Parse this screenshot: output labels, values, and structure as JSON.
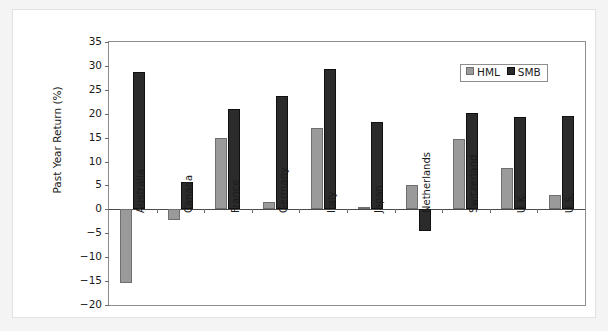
{
  "chart_data": {
    "type": "bar",
    "title": "",
    "xlabel": "",
    "ylabel": "Past Year Return (%)",
    "ylim": [
      -20,
      35
    ],
    "ytick_step": 5,
    "yticks": [
      "35",
      "30",
      "25",
      "20",
      "15",
      "10",
      "5",
      "0",
      "−5",
      "−10",
      "−15",
      "−20"
    ],
    "grid": false,
    "legend_position": "top-right",
    "categories": [
      "Australia",
      "Canada",
      "France",
      "Germany",
      "Italy",
      "Japan",
      "Netherlands",
      "Switzerland",
      "U.K.",
      "U.S."
    ],
    "series": [
      {
        "name": "HML",
        "color": "#9a9a9a",
        "values": [
          -15.5,
          -2.2,
          14.9,
          1.5,
          17.0,
          0.5,
          5.0,
          14.8,
          8.7,
          3.0
        ]
      },
      {
        "name": "SMB",
        "color": "#2b2b2b",
        "values": [
          28.7,
          5.8,
          21.0,
          23.8,
          29.3,
          18.3,
          -4.5,
          20.1,
          19.4,
          19.6
        ]
      }
    ]
  },
  "legend": {
    "items": [
      {
        "label": "HML"
      },
      {
        "label": "SMB"
      }
    ]
  },
  "colors": {
    "hml": "#9a9a9a",
    "smb": "#2b2b2b",
    "frame": "#8d8d8d",
    "page_background": "#f4f4f4",
    "sheet_background": "#ffffff"
  }
}
